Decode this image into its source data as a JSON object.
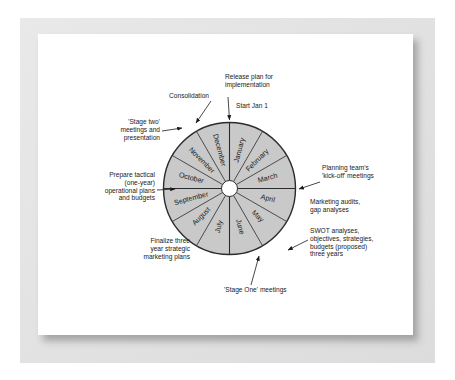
{
  "figure": {
    "type": "cyclic-planning-wheel",
    "title_present": false,
    "wheel": {
      "center": [
        229.5,
        188.5
      ],
      "outer_radius": 66,
      "hub_radius": 8,
      "segment_count": 12,
      "start_angle_deg": -90,
      "fill_color": "#c9c9c9",
      "stroke_color": "#2b2b2b",
      "months": [
        "January",
        "February",
        "March",
        "April",
        "May",
        "June",
        "July",
        "August",
        "September",
        "October",
        "November",
        "December"
      ]
    },
    "callouts": [
      {
        "id": "release-plan",
        "lines": [
          "Release plan for",
          "implementation"
        ],
        "align": "left",
        "x": 225,
        "y": 79,
        "arrow": {
          "x1": 228,
          "y1": 97,
          "x2": 229.5,
          "y2": 120
        }
      },
      {
        "id": "start-jan-1",
        "lines": [
          "Start Jan 1"
        ],
        "align": "left",
        "x": 236,
        "y": 108,
        "arrow": null
      },
      {
        "id": "consolidation",
        "lines": [
          "Consolidation"
        ],
        "align": "right",
        "x": 209,
        "y": 98,
        "arrow": {
          "x1": 211,
          "y1": 101,
          "x2": 196,
          "y2": 123
        }
      },
      {
        "id": "stage-two-meetings",
        "lines": [
          "'Stage two'",
          "meetings and",
          "presentation"
        ],
        "align": "right",
        "x": 160,
        "y": 124,
        "arrow": {
          "x1": 162,
          "y1": 131,
          "x2": 182,
          "y2": 128
        }
      },
      {
        "id": "prepare-tactical-plans",
        "lines": [
          "Prepare tactical",
          "(one-year)",
          "operational plans",
          "and budgets"
        ],
        "align": "right",
        "x": 155,
        "y": 177,
        "arrow": {
          "x1": 157,
          "y1": 190,
          "x2": 175,
          "y2": 189
        }
      },
      {
        "id": "finalize-three-year-plans",
        "lines": [
          "Finalize three",
          "year strategic",
          "marketing plans"
        ],
        "align": "right",
        "x": 190,
        "y": 243,
        "arrow": null
      },
      {
        "id": "planning-team-kickoff",
        "lines": [
          "Planning team's",
          "'kick-off' meetings"
        ],
        "align": "left",
        "x": 322,
        "y": 170,
        "arrow": {
          "x1": 320,
          "y1": 182,
          "x2": 299,
          "y2": 189
        }
      },
      {
        "id": "marketing-audits",
        "lines": [
          "Marketing audits,",
          "gap analyses"
        ],
        "align": "left",
        "x": 310,
        "y": 204,
        "arrow": null
      },
      {
        "id": "swot-analyses",
        "lines": [
          "SWOT analyses,",
          "objectives, strategies,",
          "budgets (proposed)",
          "three years"
        ],
        "align": "left",
        "x": 310,
        "y": 233,
        "arrow": {
          "x1": 308,
          "y1": 240,
          "x2": 288,
          "y2": 250
        }
      },
      {
        "id": "stage-one-meetings",
        "lines": [
          "'Stage One' meetings"
        ],
        "align": "left",
        "x": 224,
        "y": 292,
        "arrow": {
          "x1": 251,
          "y1": 285,
          "x2": 259,
          "y2": 256
        }
      }
    ],
    "colors": {
      "segment_fill": "#c9c9c9",
      "segment_stroke": "#2b2b2b",
      "text": "#1a1a1a",
      "page_background": "#ffffff",
      "mount_background": "#e4e4e4"
    }
  }
}
